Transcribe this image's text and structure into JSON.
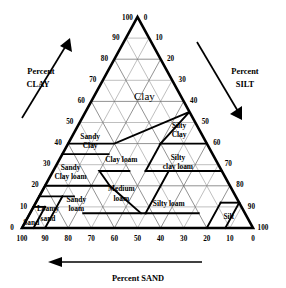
{
  "diagram": {
    "axes": {
      "clay": {
        "title_line1": "Percent",
        "title_line2": "CLAY",
        "side": "left",
        "direction": "up-right",
        "ticks": [
          0,
          10,
          20,
          30,
          40,
          50,
          60,
          70,
          80,
          90,
          100
        ]
      },
      "silt": {
        "title_line1": "Percent",
        "title_line2": "SILT",
        "side": "right",
        "direction": "down-right",
        "ticks": [
          0,
          10,
          20,
          30,
          40,
          50,
          60,
          70,
          80,
          90,
          100
        ]
      },
      "sand": {
        "title": "Percent SAND",
        "side": "bottom",
        "direction": "left",
        "ticks": [
          100,
          90,
          80,
          70,
          60,
          50,
          40,
          30,
          20,
          10,
          0
        ]
      }
    },
    "regions": [
      {
        "name": "clay",
        "label": "Clay",
        "label_lines": [
          "Clay"
        ],
        "emphasis": "big"
      },
      {
        "name": "sandy-clay",
        "label": "Sandy Clay",
        "label_lines": [
          "Sandy",
          "Clay"
        ]
      },
      {
        "name": "silty-clay",
        "label": "Silty Clay",
        "label_lines": [
          "Silty",
          "Clay"
        ]
      },
      {
        "name": "sandy-clay-loam",
        "label": "Sandy Clay loam",
        "label_lines": [
          "Sandy",
          "Clay loam"
        ]
      },
      {
        "name": "clay-loam",
        "label": "Clay loam",
        "label_lines": [
          "Clay loam"
        ]
      },
      {
        "name": "silty-clay-loam",
        "label": "Silty clay loam",
        "label_lines": [
          "Silty",
          "clay loam"
        ]
      },
      {
        "name": "sandy-loam",
        "label": "Sandy loam",
        "label_lines": [
          "Sandy",
          "loam"
        ]
      },
      {
        "name": "medium-loam",
        "label": "Medium loam",
        "label_lines": [
          "Medium",
          "loam"
        ]
      },
      {
        "name": "silty-loam",
        "label": "Silty loam",
        "label_lines": [
          "Silty loam"
        ]
      },
      {
        "name": "loamy-sand",
        "label": "Loamy sand",
        "label_lines": [
          "Loamy",
          "sand"
        ]
      },
      {
        "name": "sand",
        "label": "Sand",
        "label_lines": [
          "Sand"
        ]
      },
      {
        "name": "silt",
        "label": "Silt",
        "label_lines": [
          "Silt"
        ]
      }
    ],
    "colors": {
      "background": "#ffffff",
      "line": "#000000",
      "grid": "#8a8a8a",
      "text": "#000000"
    }
  },
  "chart_data": {
    "type": "ternary",
    "axis_titles": {
      "left": "Percent CLAY",
      "right": "Percent SILT",
      "bottom": "Percent SAND"
    },
    "axis_ranges": {
      "clay": [
        0,
        100
      ],
      "silt": [
        0,
        100
      ],
      "sand": [
        0,
        100
      ]
    },
    "tick_interval": 10,
    "grid": true,
    "legend": "none",
    "tick_labels": {
      "left": [
        "100",
        "90",
        "80",
        "70",
        "60",
        "50",
        "40",
        "30",
        "20",
        "10",
        "0"
      ],
      "right": [
        "0",
        "10",
        "20",
        "30",
        "40",
        "50",
        "60",
        "70",
        "80",
        "90",
        "100"
      ],
      "bottom": [
        "100",
        "90",
        "80",
        "70",
        "60",
        "50",
        "40",
        "30",
        "20",
        "10",
        "0"
      ]
    },
    "classes": [
      {
        "label": "Clay",
        "clay_range": [
          40,
          100
        ]
      },
      {
        "label": "Sandy Clay",
        "clay_range": [
          35,
          55
        ],
        "sand_range": [
          45,
          65
        ]
      },
      {
        "label": "Silty Clay",
        "clay_range": [
          40,
          60
        ],
        "silt_range": [
          40,
          60
        ]
      },
      {
        "label": "Sandy Clay loam",
        "clay_range": [
          20,
          35
        ],
        "sand_range": [
          45,
          80
        ]
      },
      {
        "label": "Clay loam",
        "clay_range": [
          27,
          40
        ],
        "sand_range": [
          20,
          45
        ]
      },
      {
        "label": "Silty clay loam",
        "clay_range": [
          27,
          40
        ],
        "silt_range": [
          40,
          73
        ]
      },
      {
        "label": "Sandy loam",
        "clay_range": [
          0,
          20
        ],
        "sand_range": [
          52,
          85
        ]
      },
      {
        "label": "Medium loam",
        "clay_range": [
          7,
          27
        ],
        "sand_range": [
          23,
          52
        ]
      },
      {
        "label": "Silty loam",
        "clay_range": [
          0,
          27
        ],
        "silt_range": [
          50,
          88
        ]
      },
      {
        "label": "Loamy sand",
        "clay_range": [
          0,
          15
        ],
        "sand_range": [
          70,
          90
        ]
      },
      {
        "label": "Sand",
        "clay_range": [
          0,
          10
        ],
        "sand_range": [
          85,
          100
        ]
      },
      {
        "label": "Silt",
        "clay_range": [
          0,
          12
        ],
        "silt_range": [
          80,
          100
        ]
      }
    ]
  }
}
